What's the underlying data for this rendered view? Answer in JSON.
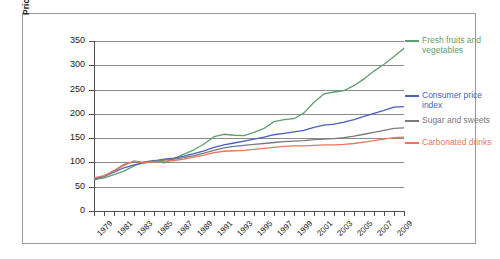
{
  "chart_data": {
    "type": "line",
    "title": "",
    "xlabel": "",
    "ylabel": "Price Index (1982–1984 = 100)",
    "ylim": [
      0,
      350
    ],
    "yticks": [
      0,
      50,
      100,
      150,
      200,
      250,
      300,
      350
    ],
    "xlim": [
      1978,
      2009
    ],
    "x": [
      1978,
      1979,
      1980,
      1981,
      1982,
      1983,
      1984,
      1985,
      1986,
      1987,
      1988,
      1989,
      1990,
      1991,
      1992,
      1993,
      1994,
      1995,
      1996,
      1997,
      1998,
      1999,
      2000,
      2001,
      2002,
      2003,
      2004,
      2005,
      2006,
      2007,
      2008,
      2009
    ],
    "xticks": [
      1978,
      1979,
      1980,
      1981,
      1982,
      1983,
      1984,
      1985,
      1986,
      1987,
      1988,
      1989,
      1990,
      1991,
      1992,
      1993,
      1994,
      1995,
      1996,
      1997,
      1998,
      1999,
      2000,
      2001,
      2002,
      2003,
      2004,
      2005,
      2006,
      2007,
      2008,
      2009
    ],
    "xticklabels": [
      "",
      "1979",
      "",
      "1981",
      "",
      "1983",
      "",
      "1985",
      "",
      "1987",
      "",
      "1989",
      "",
      "1991",
      "",
      "1993",
      "",
      "1995",
      "",
      "1997",
      "",
      "1999",
      "",
      "2001",
      "",
      "2003",
      "",
      "2005",
      "",
      "2007",
      "",
      "2009"
    ],
    "grid": true,
    "legend_position": "right",
    "series": [
      {
        "name": "Fresh fruits and vegetables",
        "color": "#5f9e6e",
        "values": [
          64,
          68,
          75,
          82,
          93,
          101,
          104,
          99,
          108,
          117,
          126,
          138,
          153,
          158,
          156,
          155,
          162,
          170,
          184,
          188,
          190,
          202,
          224,
          241,
          245,
          248,
          258,
          272,
          288,
          302,
          318,
          335
        ]
      },
      {
        "name": "Consumer price index",
        "color": "#4a5fbf",
        "values": [
          66,
          71,
          80,
          89,
          95,
          99,
          103,
          107,
          109,
          113,
          118,
          124,
          131,
          136,
          140,
          144,
          148,
          152,
          157,
          160,
          163,
          166,
          172,
          177,
          179,
          183,
          188,
          195,
          201,
          207,
          214,
          215
        ]
      },
      {
        "name": "Sugar and sweets",
        "color": "#7a7a7a",
        "values": [
          67,
          72,
          83,
          96,
          101,
          100,
          102,
          105,
          107,
          110,
          114,
          119,
          125,
          130,
          133,
          135,
          137,
          139,
          141,
          143,
          144,
          145,
          147,
          148,
          149,
          151,
          154,
          158,
          162,
          166,
          170,
          171
        ]
      },
      {
        "name": "Carbonated drinks",
        "color": "#e8775e",
        "values": [
          68,
          73,
          82,
          94,
          103,
          99,
          101,
          102,
          104,
          107,
          111,
          115,
          120,
          123,
          124,
          125,
          127,
          129,
          131,
          133,
          134,
          134,
          135,
          136,
          136,
          137,
          139,
          142,
          145,
          148,
          151,
          152
        ]
      }
    ]
  },
  "legend": {
    "items": [
      {
        "label": "Fresh fruits and vegetables",
        "color": "#5f9e6e"
      },
      {
        "label": "Consumer price index",
        "color": "#4a5fbf"
      },
      {
        "label": "Sugar and sweets",
        "color": "#7a7a7a"
      },
      {
        "label": "Carbonated drinks",
        "color": "#e8775e"
      }
    ]
  }
}
